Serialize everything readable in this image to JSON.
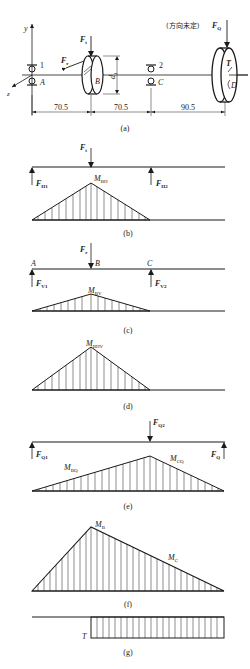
{
  "figure": {
    "panel_a": {
      "caption": "(a)",
      "axis_y": "y",
      "axis_z": "z",
      "bearing_1": "1",
      "bearing_2": "2",
      "point_A": "A",
      "point_B": "B",
      "point_C": "C",
      "point_D": "D",
      "force_Ft": "F",
      "force_Ft_sub": "t",
      "force_Fr": "F",
      "force_Fr_sub": "r",
      "diameter": "d",
      "diameter_sub": "1",
      "torque": "T",
      "force_FQ_note": "(方向未定)",
      "force_FQ": "F",
      "force_FQ_sub": "Q",
      "dimensions": [
        "70.5",
        "70.5",
        "90.5"
      ]
    },
    "panel_b": {
      "caption": "(b)",
      "load": "F",
      "load_sub": "t",
      "reaction_1": "F",
      "reaction_1_sub": "H1",
      "reaction_2": "F",
      "reaction_2_sub": "H2",
      "moment": "M",
      "moment_sub": "BH"
    },
    "panel_c": {
      "caption": "(c)",
      "point_A": "A",
      "point_B": "B",
      "point_C": "C",
      "load": "F",
      "load_sub": "r",
      "reaction_1": "F",
      "reaction_1_sub": "V1",
      "reaction_2": "F",
      "reaction_2_sub": "V2",
      "moment": "M",
      "moment_sub": "BV"
    },
    "panel_d": {
      "caption": "(d)",
      "moment": "M",
      "moment_sub": "BHV"
    },
    "panel_e": {
      "caption": "(e)",
      "load": "F",
      "load_sub": "Q2",
      "reaction_1": "F",
      "reaction_1_sub": "Q1",
      "reaction_2": "F",
      "reaction_2_sub": "Q",
      "moment_B": "M",
      "moment_B_sub": "BQ",
      "moment_C": "M",
      "moment_C_sub": "CQ"
    },
    "panel_f": {
      "caption": "(f)",
      "moment_B": "M",
      "moment_B_sub": "B",
      "moment_C": "M",
      "moment_C_sub": "C"
    },
    "panel_g": {
      "caption": "(g)",
      "torque": "T"
    }
  }
}
